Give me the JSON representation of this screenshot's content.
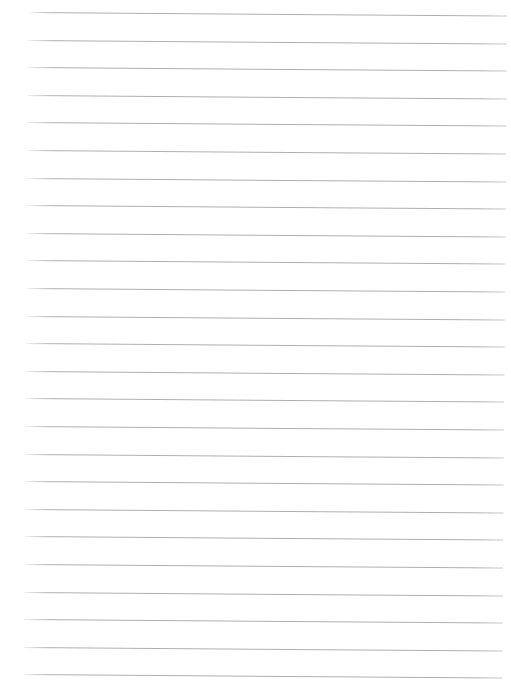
{
  "document": {
    "kind": "lined-paper-scan",
    "title": "Blank ruled notebook page",
    "body_text": "",
    "written_content": "",
    "page_width": 511,
    "page_height": 695,
    "background_color": "#ffffff"
  },
  "ruling": {
    "style": "horizontal-ruled",
    "line_color": "#a9a9ad",
    "line_thickness": 1,
    "line_count": 25,
    "line_spacing": 27.6,
    "first_line_y": 12,
    "line_start_x": 29,
    "line_end_x": 507,
    "skew_degrees": 0.42,
    "has_margin_rule": false,
    "has_punch_holes": false,
    "lines": [
      {
        "index": 1,
        "y": 12,
        "x1": 29,
        "x2": 507
      },
      {
        "index": 2,
        "y": 39.6,
        "x1": 29,
        "x2": 507
      },
      {
        "index": 3,
        "y": 67.2,
        "x1": 29,
        "x2": 507
      },
      {
        "index": 4,
        "y": 94.8,
        "x1": 29,
        "x2": 507
      },
      {
        "index": 5,
        "y": 122.4,
        "x1": 29,
        "x2": 507
      },
      {
        "index": 6,
        "y": 150.0,
        "x1": 29,
        "x2": 507
      },
      {
        "index": 7,
        "y": 177.6,
        "x1": 29,
        "x2": 507
      },
      {
        "index": 8,
        "y": 205.2,
        "x1": 29,
        "x2": 507
      },
      {
        "index": 9,
        "y": 232.8,
        "x1": 29,
        "x2": 507
      },
      {
        "index": 10,
        "y": 260.4,
        "x1": 29,
        "x2": 507
      },
      {
        "index": 11,
        "y": 288.0,
        "x1": 29,
        "x2": 507
      },
      {
        "index": 12,
        "y": 315.6,
        "x1": 29,
        "x2": 507
      },
      {
        "index": 13,
        "y": 343.2,
        "x1": 29,
        "x2": 507
      },
      {
        "index": 14,
        "y": 370.8,
        "x1": 29,
        "x2": 507
      },
      {
        "index": 15,
        "y": 398.4,
        "x1": 29,
        "x2": 507
      },
      {
        "index": 16,
        "y": 426.0,
        "x1": 29,
        "x2": 507
      },
      {
        "index": 17,
        "y": 453.6,
        "x1": 29,
        "x2": 507
      },
      {
        "index": 18,
        "y": 481.2,
        "x1": 29,
        "x2": 507
      },
      {
        "index": 19,
        "y": 508.8,
        "x1": 29,
        "x2": 507
      },
      {
        "index": 20,
        "y": 536.4,
        "x1": 29,
        "x2": 507
      },
      {
        "index": 21,
        "y": 564.0,
        "x1": 29,
        "x2": 507
      },
      {
        "index": 22,
        "y": 591.6,
        "x1": 29,
        "x2": 507
      },
      {
        "index": 23,
        "y": 619.2,
        "x1": 29,
        "x2": 507
      },
      {
        "index": 24,
        "y": 646.8,
        "x1": 29,
        "x2": 507
      },
      {
        "index": 25,
        "y": 674.4,
        "x1": 29,
        "x2": 507
      }
    ]
  }
}
